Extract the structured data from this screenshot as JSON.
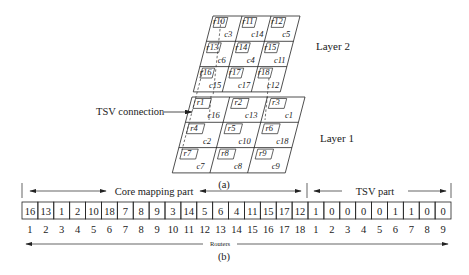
{
  "figure": {
    "part_a": {
      "caption": "(a)",
      "tsv_label": "TSV connection",
      "layers": [
        {
          "name": "Layer 2",
          "tiles": [
            {
              "router": "r10",
              "core": "c3"
            },
            {
              "router": "r11",
              "core": "c14"
            },
            {
              "router": "r12",
              "core": "c5"
            },
            {
              "router": "r13",
              "core": "c6"
            },
            {
              "router": "r14",
              "core": "c4"
            },
            {
              "router": "r15",
              "core": "c11"
            },
            {
              "router": "r16",
              "core": "c15"
            },
            {
              "router": "r17",
              "core": "c17"
            },
            {
              "router": "r18",
              "core": "c12"
            }
          ]
        },
        {
          "name": "Layer 1",
          "tiles": [
            {
              "router": "r1",
              "core": "c16"
            },
            {
              "router": "r2",
              "core": "c13"
            },
            {
              "router": "r3",
              "core": "c1"
            },
            {
              "router": "r4",
              "core": "c2"
            },
            {
              "router": "r5",
              "core": "c10"
            },
            {
              "router": "r6",
              "core": "c18"
            },
            {
              "router": "r7",
              "core": "c7"
            },
            {
              "router": "r8",
              "core": "c8"
            },
            {
              "router": "r9",
              "core": "c9"
            }
          ]
        }
      ]
    },
    "part_b": {
      "caption": "(b)",
      "core_mapping_label": "Core mapping part",
      "tsv_part_label": "TSV part",
      "routers_label": "Routers",
      "core_mapping_values": [
        "16",
        "13",
        "1",
        "2",
        "10",
        "18",
        "7",
        "8",
        "9",
        "3",
        "14",
        "5",
        "6",
        "4",
        "11",
        "15",
        "17",
        "12"
      ],
      "core_mapping_indices": [
        "1",
        "2",
        "3",
        "4",
        "5",
        "6",
        "7",
        "8",
        "9",
        "10",
        "11",
        "12",
        "13",
        "14",
        "15",
        "16",
        "17",
        "18"
      ],
      "tsv_values": [
        "1",
        "0",
        "0",
        "0",
        "0",
        "1",
        "1",
        "0",
        "0"
      ],
      "tsv_indices": [
        "1",
        "2",
        "3",
        "4",
        "5",
        "6",
        "7",
        "8",
        "9"
      ]
    }
  }
}
